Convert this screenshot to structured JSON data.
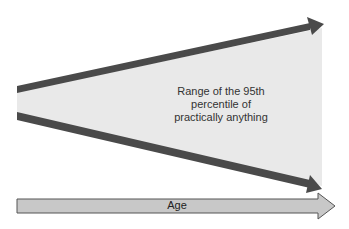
{
  "diagram": {
    "range_label": "Range of the 95th percentile of practically anything",
    "range_label_lines": [
      "Range of the 95th",
      "percentile of",
      "practically anything"
    ],
    "axis_label": "Age",
    "colors": {
      "fill": "#e9e9e9",
      "boundary": "#4a4a4a",
      "axis_fill": "#c8c8c8",
      "axis_stroke": "#555555"
    }
  }
}
